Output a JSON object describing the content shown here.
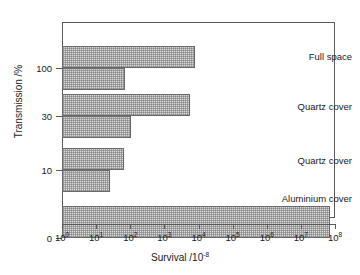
{
  "chart_data": {
    "type": "bar",
    "orientation": "horizontal",
    "title": "",
    "xlabel": "Survival /10",
    "xlabel_exponent": "-8",
    "ylabel": "Transmission /%",
    "x_scale": "log",
    "xlim": [
      1,
      100000000
    ],
    "x_ticks": [
      {
        "value": 1,
        "mantissa": "10",
        "exponent": "0"
      },
      {
        "value": 10,
        "mantissa": "10",
        "exponent": "1"
      },
      {
        "value": 100,
        "mantissa": "10",
        "exponent": "2"
      },
      {
        "value": 1000,
        "mantissa": "10",
        "exponent": "3"
      },
      {
        "value": 10000,
        "mantissa": "10",
        "exponent": "4"
      },
      {
        "value": 100000,
        "mantissa": "10",
        "exponent": "5"
      },
      {
        "value": 1000000,
        "mantissa": "10",
        "exponent": "6"
      },
      {
        "value": 10000000,
        "mantissa": "10",
        "exponent": "7"
      },
      {
        "value": 100000000,
        "mantissa": "10",
        "exponent": "8"
      }
    ],
    "y_ticks": [
      {
        "label": "100",
        "value": 100
      },
      {
        "label": "30",
        "value": 30
      },
      {
        "label": "10",
        "value": 10
      },
      {
        "label": "0",
        "value": 0
      }
    ],
    "grid": false,
    "legend": "none",
    "groups": [
      {
        "annotation": "Full space",
        "transmission": 100,
        "bars": [
          {
            "survival": 8000
          },
          {
            "survival": 70
          }
        ]
      },
      {
        "annotation": "Quartz cover",
        "transmission": 30,
        "bars": [
          {
            "survival": 5600
          },
          {
            "survival": 105
          }
        ]
      },
      {
        "annotation": "Quartz cover",
        "transmission": 10,
        "bars": [
          {
            "survival": 64
          },
          {
            "survival": 25
          }
        ]
      },
      {
        "annotation": "Aluminium cover",
        "transmission": 0,
        "bars": [
          {
            "survival": 70000000
          }
        ]
      }
    ],
    "bars_geometry": [
      {
        "name": "full-space-upper",
        "top": 24,
        "height": 22,
        "end_value": 8000
      },
      {
        "name": "full-space-lower",
        "top": 46,
        "height": 22,
        "end_value": 70
      },
      {
        "name": "quartz-cover-30-upper",
        "top": 72,
        "height": 22,
        "end_value": 5600
      },
      {
        "name": "quartz-cover-30-lower",
        "top": 94,
        "height": 22,
        "end_value": 105
      },
      {
        "name": "quartz-cover-10-upper",
        "top": 126,
        "height": 22,
        "end_value": 64
      },
      {
        "name": "quartz-cover-10-lower",
        "top": 148,
        "height": 22,
        "end_value": 25
      },
      {
        "name": "aluminium-cover-bar",
        "top": 184,
        "height": 32,
        "end_value": 70000000
      }
    ],
    "y_tick_positions": [
      46,
      94,
      148,
      216
    ],
    "annotation_positions": [
      34,
      84,
      138,
      176
    ],
    "colors": {
      "bar_fill": "#d9d9d9",
      "bar_edge": "#6a6a6a",
      "axis": "#5a5a5a",
      "text": "#1a1a1a",
      "background": "#ffffff"
    }
  }
}
